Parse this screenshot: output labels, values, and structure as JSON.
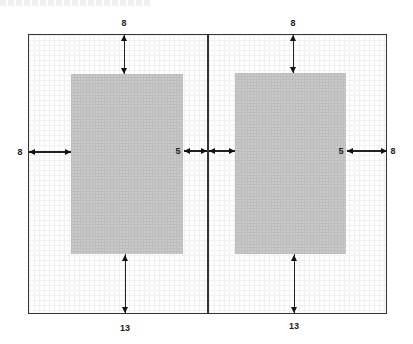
{
  "diagram": {
    "colors": {
      "frame": "#333333",
      "text_block": "#c9c9c9",
      "grid": "#f1f1f1",
      "arrow": "#111111"
    },
    "left_page": {
      "top_margin": "8",
      "bottom_margin": "13",
      "outer_margin": "8",
      "inner_margin": "5"
    },
    "right_page": {
      "top_margin": "8",
      "bottom_margin": "13",
      "inner_margin": "5",
      "outer_margin": "8"
    }
  }
}
